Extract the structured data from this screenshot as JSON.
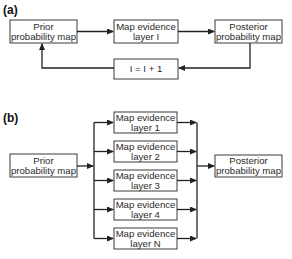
{
  "panel_a": {
    "label": "(a)",
    "prior": {
      "line1": "Prior",
      "line2": "probability map"
    },
    "evidence": {
      "line1": "Map evidence",
      "line2": "layer I"
    },
    "posterior": {
      "line1": "Posterior",
      "line2": "probability map"
    },
    "loop": {
      "text": "I = I +  1"
    }
  },
  "panel_b": {
    "label": "(b)",
    "prior": {
      "line1": "Prior",
      "line2": "probability map"
    },
    "layers": [
      {
        "line1": "Map evidence",
        "line2": "layer 1"
      },
      {
        "line1": "Map evidence",
        "line2": "layer 2"
      },
      {
        "line1": "Map evidence",
        "line2": "layer 3"
      },
      {
        "line1": "Map evidence",
        "line2": "layer 4"
      },
      {
        "line1": "Map evidence",
        "line2": "layer N"
      }
    ],
    "posterior": {
      "line1": "Posterior",
      "line2": "probability map"
    }
  }
}
